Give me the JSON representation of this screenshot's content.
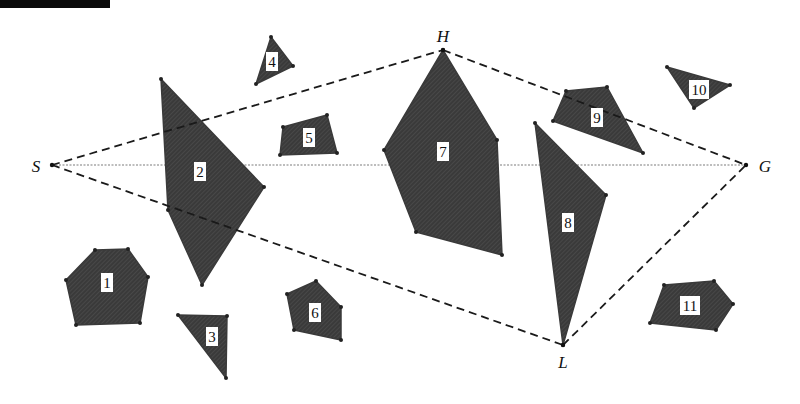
{
  "figure": {
    "type": "path-planning-visibility-diagram",
    "header_bar": "",
    "colors": {
      "obstacle_fill": "#3a3a3a",
      "dashed_path": "#1a1a1a",
      "dotted_line": "#a8a8a8",
      "label_bg": "#ffffff",
      "background": "#ffffff"
    },
    "points": [
      {
        "id": "S",
        "label": "S",
        "x": 52,
        "y": 165,
        "label_x": 36,
        "label_y": 172
      },
      {
        "id": "H",
        "label": "H",
        "x": 443,
        "y": 50,
        "label_x": 443,
        "label_y": 42
      },
      {
        "id": "G",
        "label": "G",
        "x": 746,
        "y": 165,
        "label_x": 765,
        "label_y": 172
      },
      {
        "id": "L",
        "label": "L",
        "x": 563,
        "y": 345,
        "label_x": 563,
        "label_y": 368
      }
    ],
    "dashed_paths": [
      {
        "from": "S",
        "to": "H"
      },
      {
        "from": "H",
        "to": "G"
      },
      {
        "from": "S",
        "to": "L"
      },
      {
        "from": "L",
        "to": "G"
      }
    ],
    "dotted_line": {
      "from": "S",
      "to": "G"
    },
    "obstacles": [
      {
        "id": "1",
        "label": "1",
        "label_x": 107,
        "label_y": 283,
        "points": "95,250 128,249 148,277 140,323 76,325 66,280"
      },
      {
        "id": "2",
        "label": "2",
        "label_x": 200,
        "label_y": 172,
        "points": "161,79 264,187 202,285 168,210"
      },
      {
        "id": "3",
        "label": "3",
        "label_x": 212,
        "label_y": 337,
        "points": "178,315 227,316 226,378"
      },
      {
        "id": "4",
        "label": "4",
        "label_x": 272,
        "label_y": 62,
        "points": "271,37 293,66 256,84"
      },
      {
        "id": "5",
        "label": "5",
        "label_x": 309,
        "label_y": 138,
        "points": "283,127 327,115 337,153 280,155"
      },
      {
        "id": "6",
        "label": "6",
        "label_x": 315,
        "label_y": 313,
        "points": "287,294 316,281 341,307 341,340 294,330"
      },
      {
        "id": "7",
        "label": "7",
        "label_x": 443,
        "label_y": 152,
        "points": "443,50 497,140 502,255 416,232 384,150"
      },
      {
        "id": "8",
        "label": "8",
        "label_x": 568,
        "label_y": 223,
        "points": "535,123 606,195 563,345"
      },
      {
        "id": "9",
        "label": "9",
        "label_x": 597,
        "label_y": 118,
        "points": "566,91 607,87 643,153 553,121"
      },
      {
        "id": "10",
        "label": "10",
        "label_x": 699,
        "label_y": 90,
        "points": "667,67 730,85 694,108"
      },
      {
        "id": "11",
        "label": "11",
        "label_x": 690,
        "label_y": 306,
        "points": "664,285 714,281 733,304 716,330 650,323"
      }
    ]
  }
}
